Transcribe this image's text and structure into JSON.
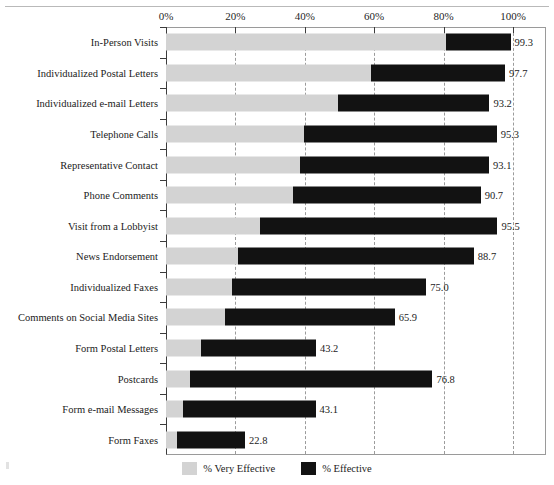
{
  "chart_data": {
    "type": "bar",
    "orientation": "horizontal",
    "stacked": true,
    "title": "",
    "xlabel": "",
    "ylabel": "",
    "xlim": [
      0,
      100
    ],
    "xticks": [
      "0%",
      "20%",
      "40%",
      "60%",
      "80%",
      "100%"
    ],
    "xtick_values": [
      0,
      20,
      40,
      60,
      80,
      100
    ],
    "grid": "vertical-dashed",
    "legend_position": "bottom-right",
    "legend": [
      "% Very Effective",
      "% Effective"
    ],
    "series": [
      {
        "name": "% Very Effective",
        "color": "#d3d3d3",
        "values": [
          80.7,
          59.0,
          49.5,
          39.7,
          38.5,
          36.5,
          27.0,
          20.8,
          19.0,
          17.0,
          10.0,
          7.0,
          5.0,
          3.2
        ]
      },
      {
        "name": "% Effective",
        "color": "#121212",
        "values": [
          18.6,
          38.7,
          43.7,
          55.6,
          54.6,
          54.2,
          68.5,
          67.9,
          56.0,
          48.9,
          33.2,
          69.8,
          38.1,
          19.6
        ]
      }
    ],
    "categories": [
      "In-Person Visits",
      "Individualized Postal Letters",
      "Individualized e-mail Letters",
      "Telephone Calls",
      "Representative Contact",
      "Phone Comments",
      "Visit from a Lobbyist",
      "News Endorsement",
      "Individualized Faxes",
      "Comments on Social Media Sites",
      "Form Postal Letters",
      "Postcards",
      "Form e-mail Messages",
      "Form Faxes"
    ],
    "totals": [
      99.3,
      97.7,
      93.2,
      95.3,
      93.1,
      90.7,
      95.5,
      88.7,
      75.0,
      65.9,
      43.2,
      76.8,
      43.1,
      22.8
    ],
    "data_labels": [
      "99.3",
      "97.7",
      "93.2",
      "95.3",
      "93.1",
      "90.7",
      "95.5",
      "88.7",
      "75.0",
      "65.9",
      "43.2",
      "76.8",
      "43.1",
      "22.8"
    ]
  },
  "title_remnant": "",
  "colors": {
    "very_effective": "#d3d3d3",
    "effective": "#121212",
    "axis": "#3c3c3c",
    "grid": "#9b9b9b",
    "frame": "#9a9a9a",
    "background": "#ffffff"
  }
}
